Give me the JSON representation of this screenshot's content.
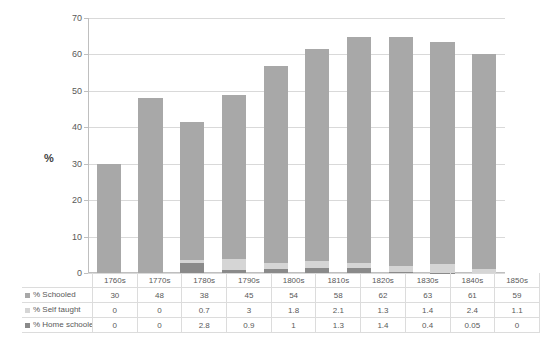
{
  "chart_data": {
    "type": "bar",
    "stacked": true,
    "title": "",
    "xlabel": "",
    "ylabel": "%",
    "ylim": [
      0,
      70
    ],
    "ytick_step": 10,
    "yticks": [
      0,
      10,
      20,
      30,
      40,
      50,
      60,
      70
    ],
    "grid": true,
    "legend_position": "data-table",
    "categories": [
      "1760s",
      "1770s",
      "1780s",
      "1790s",
      "1800s",
      "1810s",
      "1820s",
      "1830s",
      "1840s",
      "1850s"
    ],
    "series": [
      {
        "name": "% Schooled",
        "color": "#a8a8a8",
        "values": [
          30,
          48,
          38,
          45,
          54,
          58,
          62,
          63,
          61,
          59
        ]
      },
      {
        "name": "% Self taught",
        "color": "#d5d5d5",
        "values": [
          0,
          0,
          0.7,
          3,
          1.8,
          2.1,
          1.3,
          1.4,
          2.4,
          1.1
        ]
      },
      {
        "name": "% Home schooled",
        "color": "#8a8a8a",
        "values": [
          0,
          0,
          2.8,
          0.9,
          1,
          1.3,
          1.4,
          0.4,
          0.05,
          0
        ]
      }
    ],
    "bar_totals": [
      30,
      48,
      41.5,
      48.9,
      56.8,
      61.4,
      64.7,
      64.8,
      63.45,
      60.1
    ]
  },
  "axis": {
    "y_title": "%",
    "tick_labels": [
      "70",
      "60",
      "50",
      "40",
      "30",
      "20",
      "10",
      "0"
    ]
  },
  "table": {
    "row_labels": [
      "% Schooled",
      "% Self taught",
      "% Home schooled"
    ],
    "header": [
      "",
      "1760s",
      "1770s",
      "1780s",
      "1790s",
      "1800s",
      "1810s",
      "1820s",
      "1830s",
      "1840s",
      "1850s"
    ],
    "rows": [
      [
        "30",
        "48",
        "38",
        "45",
        "54",
        "58",
        "62",
        "63",
        "61",
        "59"
      ],
      [
        "0",
        "0",
        "0.7",
        "3",
        "1.8",
        "2.1",
        "1.3",
        "1.4",
        "2.4",
        "1.1"
      ],
      [
        "0",
        "0",
        "2.8",
        "0.9",
        "1",
        "1.3",
        "1.4",
        "0.4",
        "0.05",
        "0"
      ]
    ]
  },
  "colors": {
    "schooled": "#a8a8a8",
    "self_taught": "#d5d5d5",
    "home_schooled": "#8a8a8a",
    "gridline": "#d9d9d9",
    "axis": "#bfbfbf",
    "text": "#595959"
  }
}
